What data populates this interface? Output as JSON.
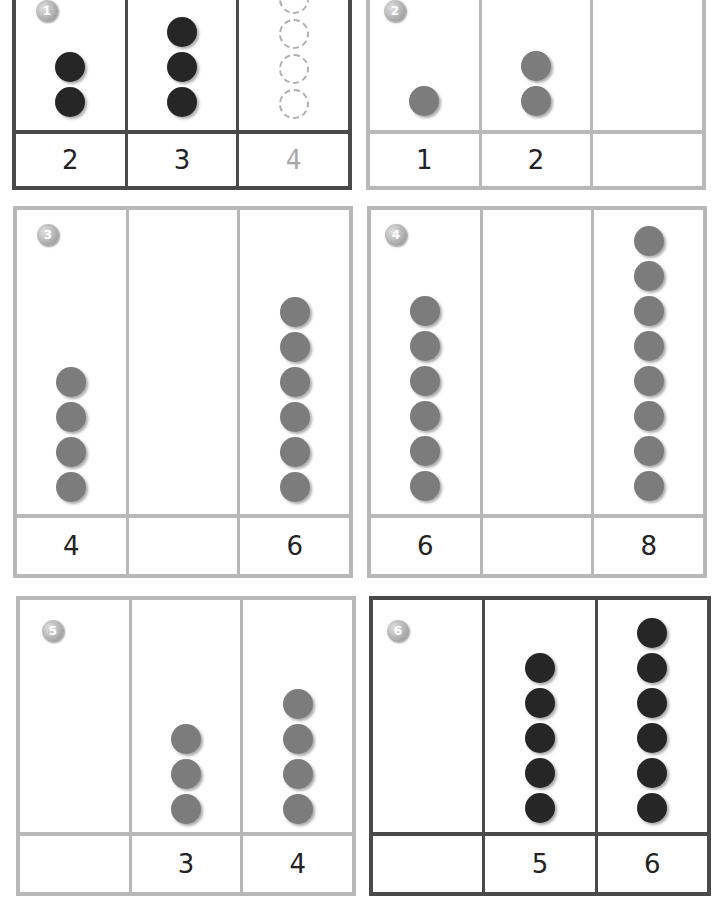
{
  "puzzles": [
    {
      "number": "1",
      "style": "dark",
      "dot_color": "black",
      "columns": [
        {
          "dots": 2,
          "label": "2"
        },
        {
          "dots": 3,
          "label": "3"
        },
        {
          "dots": 4,
          "label": "4",
          "traced": true
        }
      ]
    },
    {
      "number": "2",
      "style": "light",
      "dot_color": "grey",
      "columns": [
        {
          "dots": 1,
          "label": "1"
        },
        {
          "dots": 2,
          "label": "2"
        },
        {
          "dots": 0,
          "label": ""
        }
      ]
    },
    {
      "number": "3",
      "style": "light",
      "dot_color": "grey",
      "columns": [
        {
          "dots": 4,
          "label": "4"
        },
        {
          "dots": 0,
          "label": ""
        },
        {
          "dots": 6,
          "label": "6"
        }
      ]
    },
    {
      "number": "4",
      "style": "light",
      "dot_color": "grey",
      "columns": [
        {
          "dots": 6,
          "label": "6"
        },
        {
          "dots": 0,
          "label": ""
        },
        {
          "dots": 8,
          "label": "8"
        }
      ]
    },
    {
      "number": "5",
      "style": "light",
      "dot_color": "grey",
      "columns": [
        {
          "dots": 0,
          "label": ""
        },
        {
          "dots": 3,
          "label": "3"
        },
        {
          "dots": 4,
          "label": "4"
        }
      ]
    },
    {
      "number": "6",
      "style": "dark",
      "dot_color": "black",
      "columns": [
        {
          "dots": 0,
          "label": ""
        },
        {
          "dots": 5,
          "label": "5"
        },
        {
          "dots": 6,
          "label": "6"
        }
      ]
    }
  ]
}
